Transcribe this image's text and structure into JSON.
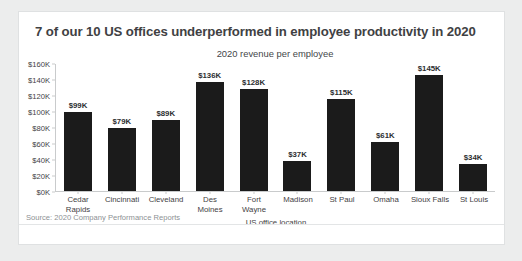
{
  "card": {
    "title": "7 of our 10 US offices underperformed in employee productivity in 2020",
    "subtitle": "2020 revenue per employee",
    "source": "Source: 2020 Company Performance Reports"
  },
  "colors": {
    "page_background": "#eceded",
    "card_background": "#ffffff",
    "card_border": "#dfe1e2",
    "bar": "#1b1b1b",
    "axis": "#c9cbcc",
    "title_text": "#3f4143",
    "source_text": "#8d9194"
  },
  "chart_data": {
    "type": "bar",
    "title": "2020 revenue per employee",
    "xlabel": "US office location",
    "ylabel": "",
    "ylim": [
      0,
      160
    ],
    "units": "thousands of USD",
    "grid": false,
    "legend": "none",
    "categories": [
      "Cedar Rapids",
      "Cincinnati",
      "Cleveland",
      "Des Moines",
      "Fort Wayne",
      "Madison",
      "St Paul",
      "Omaha",
      "Sioux Falls",
      "St Louis"
    ],
    "category_lines": [
      [
        "Cedar",
        "Rapids"
      ],
      [
        "Cincinnati",
        ""
      ],
      [
        "Cleveland",
        ""
      ],
      [
        "Des",
        "Moines"
      ],
      [
        "Fort",
        "Wayne"
      ],
      [
        "Madison",
        ""
      ],
      [
        "St Paul",
        ""
      ],
      [
        "Omaha",
        ""
      ],
      [
        "Sioux Falls",
        ""
      ],
      [
        "St Louis",
        ""
      ]
    ],
    "values": [
      99,
      79,
      89,
      136,
      128,
      37,
      115,
      61,
      145,
      34
    ],
    "data_labels": [
      "$99K",
      "$79K",
      "$89K",
      "$136K",
      "$128K",
      "$37K",
      "$115K",
      "$61K",
      "$145K",
      "$34K"
    ],
    "yticks": [
      0,
      20,
      40,
      60,
      80,
      100,
      120,
      140,
      160
    ],
    "ytick_labels": [
      "$0K",
      "$20K",
      "$40K",
      "$60K",
      "$80K",
      "$100K",
      "$120K",
      "$140K",
      "$160K"
    ]
  }
}
